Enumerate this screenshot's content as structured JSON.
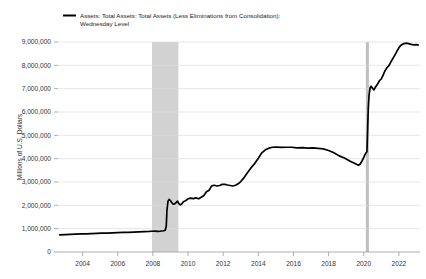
{
  "chart_data": {
    "type": "line",
    "title": "",
    "subtitle": "",
    "xlabel": "",
    "ylabel": "Millions of U.S. Dollars",
    "legend": [
      {
        "name": "Assets: Total Assets: Total Assets (Less Eliminations from Consolidation): Wednesday Level",
        "line1": "Assets: Total Assets: Total Assets (Less Eliminations from Consolidation):",
        "line2": "Wednesday Level",
        "color": "#000000"
      }
    ],
    "legend_position": "top-left",
    "grid": true,
    "xlim": [
      2002.6,
      2023.2
    ],
    "ylim": [
      0,
      9000000
    ],
    "yticks": [
      0,
      1000000,
      2000000,
      3000000,
      4000000,
      5000000,
      6000000,
      7000000,
      8000000,
      9000000
    ],
    "ytick_labels": [
      "0",
      "1,000,000",
      "2,000,000",
      "3,000,000",
      "4,000,000",
      "5,000,000",
      "6,000,000",
      "7,000,000",
      "8,000,000",
      "9,000,000"
    ],
    "xticks": [
      2004,
      2006,
      2008,
      2010,
      2012,
      2014,
      2016,
      2018,
      2020,
      2022
    ],
    "xtick_labels": [
      "2004",
      "2006",
      "2008",
      "2010",
      "2012",
      "2014",
      "2016",
      "2018",
      "2020",
      "2022"
    ],
    "recession_bands": [
      {
        "start": 2007.95,
        "end": 2009.45,
        "color": "#d2d2d2"
      },
      {
        "start": 2020.12,
        "end": 2020.29,
        "color": "#bfbfbf"
      }
    ],
    "series": [
      {
        "name": "Assets: Total Assets: Total Assets (Less Eliminations from Consolidation): Wednesday Level",
        "color": "#000000",
        "x": [
          2002.7,
          2003.0,
          2003.3,
          2003.6,
          2003.9,
          2004.2,
          2004.5,
          2004.8,
          2005.1,
          2005.4,
          2005.7,
          2006.0,
          2006.3,
          2006.6,
          2006.9,
          2007.2,
          2007.5,
          2007.8,
          2007.95,
          2008.1,
          2008.3,
          2008.5,
          2008.62,
          2008.7,
          2008.76,
          2008.8,
          2008.86,
          2008.92,
          2009.0,
          2009.08,
          2009.16,
          2009.24,
          2009.32,
          2009.4,
          2009.48,
          2009.56,
          2009.64,
          2009.72,
          2009.8,
          2009.9,
          2010.0,
          2010.15,
          2010.3,
          2010.45,
          2010.6,
          2010.75,
          2010.9,
          2011.05,
          2011.2,
          2011.35,
          2011.5,
          2011.65,
          2011.8,
          2011.95,
          2012.1,
          2012.25,
          2012.4,
          2012.55,
          2012.7,
          2012.85,
          2013.0,
          2013.2,
          2013.4,
          2013.6,
          2013.8,
          2014.0,
          2014.2,
          2014.4,
          2014.6,
          2014.8,
          2015.0,
          2015.3,
          2015.6,
          2015.9,
          2016.2,
          2016.5,
          2016.8,
          2017.1,
          2017.4,
          2017.7,
          2018.0,
          2018.3,
          2018.6,
          2018.9,
          2019.2,
          2019.5,
          2019.7,
          2019.8,
          2019.9,
          2020.0,
          2020.05,
          2020.12,
          2020.18,
          2020.22,
          2020.26,
          2020.3,
          2020.36,
          2020.42,
          2020.5,
          2020.58,
          2020.66,
          2020.74,
          2020.82,
          2020.9,
          2021.0,
          2021.1,
          2021.2,
          2021.3,
          2021.4,
          2021.5,
          2021.6,
          2021.7,
          2021.8,
          2021.9,
          2022.0,
          2022.1,
          2022.2,
          2022.3,
          2022.42,
          2022.55,
          2022.7,
          2022.85,
          2023.0,
          2023.1
        ],
        "y": [
          735000,
          745000,
          755000,
          765000,
          775000,
          780000,
          790000,
          800000,
          805000,
          810000,
          820000,
          830000,
          840000,
          845000,
          855000,
          865000,
          870000,
          880000,
          890000,
          895000,
          880000,
          900000,
          910000,
          930000,
          1100000,
          1800000,
          2180000,
          2250000,
          2200000,
          2110000,
          2050000,
          2060000,
          2120000,
          2180000,
          2070000,
          2020000,
          2060000,
          2140000,
          2180000,
          2220000,
          2280000,
          2310000,
          2290000,
          2320000,
          2280000,
          2350000,
          2420000,
          2580000,
          2650000,
          2840000,
          2860000,
          2830000,
          2850000,
          2900000,
          2900000,
          2870000,
          2850000,
          2830000,
          2860000,
          2920000,
          3020000,
          3200000,
          3420000,
          3620000,
          3800000,
          4020000,
          4250000,
          4380000,
          4450000,
          4490000,
          4500000,
          4480000,
          4490000,
          4490000,
          4460000,
          4470000,
          4450000,
          4460000,
          4440000,
          4420000,
          4350000,
          4250000,
          4120000,
          4030000,
          3900000,
          3790000,
          3720000,
          3770000,
          3900000,
          4050000,
          4150000,
          4240000,
          4300000,
          5250000,
          6200000,
          6700000,
          7040000,
          7100000,
          7010000,
          6950000,
          7060000,
          7150000,
          7240000,
          7350000,
          7420000,
          7580000,
          7750000,
          7880000,
          7960000,
          8080000,
          8220000,
          8350000,
          8480000,
          8620000,
          8760000,
          8850000,
          8900000,
          8930000,
          8950000,
          8930000,
          8900000,
          8880000,
          8890000,
          8870000
        ]
      }
    ]
  }
}
